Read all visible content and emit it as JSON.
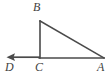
{
  "figure": {
    "background_color": "#ffffff",
    "stroke_color": "#4a4a4a",
    "label_color": "#3f3f3f",
    "width": 111,
    "height": 76
  },
  "labels": {
    "B": "B",
    "D": "D",
    "C": "C",
    "A": "A"
  },
  "geometry": {
    "points": {
      "B": {
        "x": 40,
        "y": 21
      },
      "C": {
        "x": 40,
        "y": 58
      },
      "A": {
        "x": 104,
        "y": 58
      },
      "D_arrow_tip": {
        "x": 7,
        "y": 57
      }
    },
    "segments": [
      {
        "name": "BC",
        "from": "B",
        "to": "C"
      },
      {
        "name": "CA",
        "from": "C",
        "to": "A"
      },
      {
        "name": "BA",
        "from": "B",
        "to": "A"
      }
    ],
    "rays": [
      {
        "name": "CD",
        "from": "C",
        "to": "D_arrow_tip",
        "arrow": "at-D"
      }
    ]
  }
}
